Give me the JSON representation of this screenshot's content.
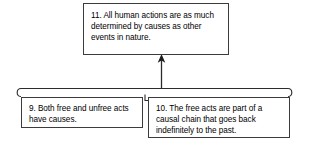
{
  "diagram": {
    "kind": "argument-map",
    "background_color": "#ffffff",
    "line_color": "#2b2b2b",
    "box_border_color": "#3c3c3c",
    "text_color": "#000000",
    "boxes": {
      "conclusion": {
        "id": "11",
        "text": "11. All human actions are as much determined by causes as other events in nature."
      },
      "premise_9": {
        "id": "9",
        "text": "9. Both free and unfree acts have causes."
      },
      "premise_10": {
        "id": "10",
        "text": "10. The free acts are part of a causal chain that goes back indefinitely to the past."
      }
    },
    "connector": {
      "type": "linked-premise-bracket",
      "description": "Horizontal bracket with curled ends joining premises 9 and 10, with a single arrow rising to conclusion 11",
      "arrow_direction": "up",
      "arrow_target": "11",
      "arrow_sources": [
        "9",
        "10"
      ]
    }
  }
}
